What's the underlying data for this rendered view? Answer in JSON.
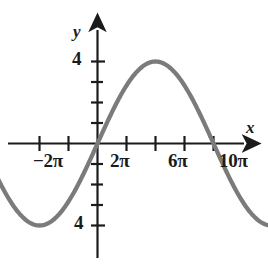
{
  "figure": {
    "background_color": "#ffffff",
    "curve_color": "#7b7b7b",
    "axis_color": "#1b1b1b",
    "width": 268,
    "height": 266
  },
  "axis_labels": {
    "x": "x",
    "y": "y"
  },
  "x_tick_labels": [
    {
      "text": "−2π",
      "value": -2
    },
    {
      "text": "2π",
      "value": 2
    },
    {
      "text": "6π",
      "value": 6
    },
    {
      "text": "10π",
      "value": 10
    }
  ],
  "y_tick_labels": [
    {
      "text": "4",
      "value": 4
    },
    {
      "text": "4",
      "value": -4
    }
  ],
  "chart_data": {
    "type": "line",
    "title": "",
    "subtitle": "",
    "xlabel": "x",
    "ylabel": "y",
    "grid": false,
    "legend": "none",
    "xlim": [
      -4.6,
      11.4
    ],
    "ylim": [
      -5.6,
      5.4
    ],
    "x_unit": "pi",
    "x_ticks": [
      -4,
      -2,
      0,
      2,
      4,
      6,
      8,
      10
    ],
    "x_tick_text": [
      "",
      "−2π",
      "",
      "2π",
      "",
      "6π",
      "",
      "10π"
    ],
    "y_ticks": [
      -5,
      -4,
      -3,
      -2,
      -1,
      0,
      1,
      2,
      3,
      4,
      5
    ],
    "y_tick_text": [
      "",
      "4",
      "",
      "",
      "",
      "",
      "",
      "",
      "",
      "4",
      ""
    ],
    "series": [
      {
        "name": "y = 4 sin(x/2)",
        "amplitude": 4,
        "period_in_pi": 8,
        "function": "4*sin(x/2)",
        "color": "#7b7b7b",
        "line_width": 4,
        "arrow_start": true,
        "arrow_end": true,
        "x": [
          -4.6,
          -4,
          -3,
          -2,
          -1,
          0,
          1,
          2,
          3,
          4,
          5,
          6,
          7,
          8,
          9,
          10,
          11,
          11.4
        ],
        "y": [
          -1.25,
          0,
          2.83,
          4,
          2.83,
          0,
          -2.83,
          -4,
          -2.83,
          0,
          2.83,
          4,
          2.83,
          0,
          -2.83,
          -4,
          -2.83,
          -1.25
        ]
      }
    ],
    "annotations": [
      {
        "text": "maximum",
        "x": -2,
        "y": 4
      },
      {
        "text": "minimum",
        "x": 2,
        "y": -4
      },
      {
        "text": "maximum",
        "x": 6,
        "y": 4
      },
      {
        "text": "minimum",
        "x": 10,
        "y": -4
      }
    ]
  }
}
